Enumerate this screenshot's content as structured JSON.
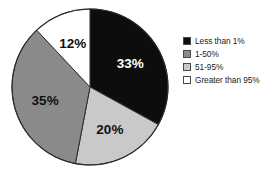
{
  "chart_data": {
    "type": "pie",
    "title": "",
    "subtitle": "",
    "xlabel": "",
    "ylabel": "",
    "grid": false,
    "legend_position": "right",
    "total": 100,
    "start_angle_deg": 0,
    "direction": "clockwise",
    "categories": [
      "Less than 1%",
      "1-50%",
      "51-95%",
      "Greater than 95%"
    ],
    "values": [
      33,
      35,
      20,
      12
    ],
    "slices": [
      {
        "label": "Less than 1%",
        "value": 33,
        "data_label": "33%",
        "color": "#0d0d0d",
        "label_color": "#ffffff",
        "start_deg": 0,
        "end_deg": 118.8
      },
      {
        "label": "51-95%",
        "value": 20,
        "data_label": "20%",
        "color": "#c9c9c9",
        "label_color": "#111111",
        "start_deg": 118.8,
        "end_deg": 190.8
      },
      {
        "label": "1-50%",
        "value": 35,
        "data_label": "35%",
        "color": "#8a8a8a",
        "label_color": "#111111",
        "start_deg": 190.8,
        "end_deg": 316.8
      },
      {
        "label": "Greater than 95%",
        "value": 12,
        "data_label": "12%",
        "color": "#ffffff",
        "label_color": "#111111",
        "start_deg": 316.8,
        "end_deg": 360
      }
    ]
  },
  "legend": {
    "items": [
      {
        "label": "Less than 1%",
        "color": "#0d0d0d"
      },
      {
        "label": "1-50%",
        "color": "#8a8a8a"
      },
      {
        "label": "51-95%",
        "color": "#c9c9c9"
      },
      {
        "label": "Greater than 95%",
        "color": "#ffffff"
      }
    ]
  },
  "colors": {
    "background": "#ffffff",
    "outline": "#2b2b2b",
    "text": "#1a1a1a",
    "swatch_border": "#4a4a4a"
  }
}
